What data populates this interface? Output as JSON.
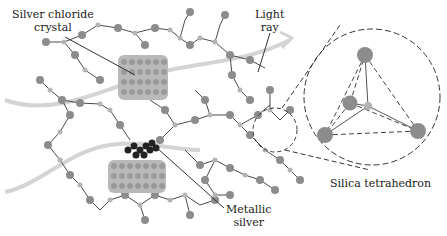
{
  "figure": {
    "labels": {
      "silver_chloride": [
        "Silver chloride",
        "crystal"
      ],
      "light_ray": [
        "Light",
        "ray"
      ],
      "metallic_silver": [
        "Metallic",
        "silver"
      ],
      "silica_tetrahedron": "Silica tetrahedron"
    },
    "colors": {
      "oxygen_atom": "#8c8c8c",
      "silicon_atom": "#b4b4b4",
      "bond": "#4a4a4a",
      "agcl_crystal": "#a9a9a9",
      "metallic_silver": "#222222",
      "light_ray": "#d2d2d2",
      "leader_line": "#333333"
    }
  }
}
